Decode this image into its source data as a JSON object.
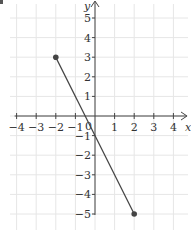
{
  "chart_data": {
    "type": "line",
    "title": "",
    "xlabel": "x",
    "ylabel": "y",
    "xlim": [
      -4,
      4
    ],
    "ylim": [
      -5,
      5
    ],
    "grid": true,
    "x_ticks": [
      -4,
      -3,
      -2,
      -1,
      1,
      2,
      3,
      4
    ],
    "y_ticks": [
      5,
      4,
      3,
      2,
      1,
      -1,
      -2,
      -3,
      -4,
      -5
    ],
    "x_tick_labels": [
      "−4",
      "−3",
      "−2",
      "−1",
      "1",
      "2",
      "3",
      "4"
    ],
    "y_tick_labels": [
      "5",
      "4",
      "3",
      "2",
      "1",
      "−1",
      "−2",
      "−3",
      "−4",
      "−5"
    ],
    "origin_label": "0",
    "series": [
      {
        "name": "segment",
        "x": [
          -2,
          2
        ],
        "y": [
          3,
          -5
        ],
        "endpoints": "closed-dots",
        "color": "#444444"
      }
    ],
    "colors": {
      "grid": "#e6e6e6",
      "axis": "#444444",
      "line": "#444444"
    }
  }
}
